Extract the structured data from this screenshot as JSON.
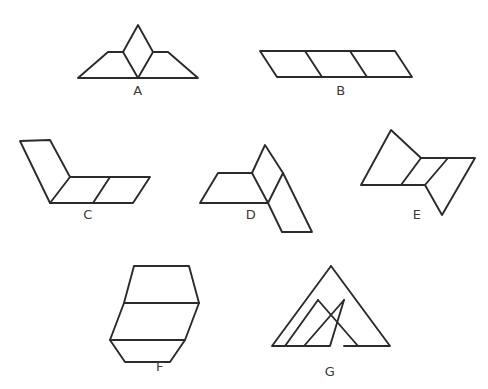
{
  "page": {
    "background_color": "#ffffff",
    "stroke_color": "#2b2b2b",
    "label_color": "#3a3a3a",
    "width": 488,
    "height": 389
  },
  "figures": [
    {
      "id": "A",
      "label": "A",
      "label_x": 138,
      "label_y": 95,
      "cell_count": 3,
      "arrangement": "left trapezoid, upright diamond in the middle, right trapezoid; flat common baseline",
      "outline": "78,78 108,52 123,52 138,25 153,52 168,52 198,78",
      "outline_points": [
        [
          78,
          78
        ],
        [
          108,
          52
        ],
        [
          123,
          52
        ],
        [
          138,
          25
        ],
        [
          153,
          52
        ],
        [
          168,
          52
        ],
        [
          198,
          78
        ]
      ],
      "base_line": [
        [
          78,
          78
        ],
        [
          198,
          78
        ]
      ],
      "dividers": [
        [
          [
            123,
            52
          ],
          [
            138,
            78
          ]
        ],
        [
          [
            153,
            52
          ],
          [
            138,
            78
          ]
        ]
      ]
    },
    {
      "id": "B",
      "label": "B",
      "label_x": 341,
      "label_y": 95,
      "cell_count": 3,
      "arrangement": "three leaning parallelogram cells in a single horizontal row",
      "outline": "260,51 395,51 412,77 277,77",
      "outline_points": [
        [
          260,
          51
        ],
        [
          395,
          51
        ],
        [
          412,
          77
        ],
        [
          277,
          77
        ]
      ],
      "dividers": [
        [
          [
            305,
            51
          ],
          [
            322,
            77
          ]
        ],
        [
          [
            350,
            51
          ],
          [
            367,
            77
          ]
        ]
      ]
    },
    {
      "id": "C",
      "label": "C",
      "label_x": 88,
      "label_y": 219,
      "cell_count": 3,
      "arrangement": "one cell slanting up-left, joined to two cells in a horizontal row",
      "outline": "20,141 50,140 70,177 150,177 150,177 133,203 50,203",
      "outline_points": [
        [
          20,
          141
        ],
        [
          50,
          140
        ],
        [
          70,
          177
        ],
        [
          150,
          177
        ],
        [
          133,
          203
        ],
        [
          50,
          203
        ]
      ],
      "dividers": [
        [
          [
            70,
            177
          ],
          [
            50,
            203
          ]
        ],
        [
          [
            110,
            177
          ],
          [
            93,
            203
          ]
        ]
      ]
    },
    {
      "id": "D",
      "label": "D",
      "label_x": 251,
      "label_y": 219,
      "cell_count": 3,
      "arrangement": "horizontal left cell, upward diamond cell, cell slanting down to the right",
      "outline": "218,173 252,173 265,145 283,173 312,232 282,232 268,203 200,203",
      "outline_points": [
        [
          218,
          173
        ],
        [
          252,
          173
        ],
        [
          265,
          145
        ],
        [
          283,
          173
        ],
        [
          312,
          232
        ],
        [
          282,
          232
        ],
        [
          268,
          203
        ],
        [
          200,
          203
        ]
      ],
      "dividers": [
        [
          [
            252,
            173
          ],
          [
            268,
            203
          ]
        ],
        [
          [
            283,
            173
          ],
          [
            268,
            203
          ]
        ]
      ]
    },
    {
      "id": "E",
      "label": "E",
      "label_x": 417,
      "label_y": 219,
      "cell_count": 3,
      "arrangement": "cell slanting up-left, horizontal middle cell, cell slanting down-right",
      "outline": "391,130 421,158 475,158 442,215 425,185 361,185",
      "outline_points": [
        [
          391,
          130
        ],
        [
          421,
          158
        ],
        [
          475,
          158
        ],
        [
          442,
          215
        ],
        [
          425,
          185
        ],
        [
          361,
          185
        ]
      ],
      "dividers": [
        [
          [
            421,
            158
          ],
          [
            401,
            185
          ]
        ],
        [
          [
            448,
            158
          ],
          [
            425,
            185
          ]
        ]
      ]
    },
    {
      "id": "F",
      "label": "F",
      "label_x": 160,
      "label_y": 371,
      "cell_count": 3,
      "arrangement": "vertical stack: wide trapezoid on top, slanted middle cell, wide trapezoid at the bottom",
      "outline": "134,266 189,266 199,303 124,303",
      "outline_points_top": [
        [
          134,
          266
        ],
        [
          189,
          266
        ],
        [
          199,
          303
        ],
        [
          124,
          303
        ]
      ],
      "outline_points_middle": [
        [
          124,
          303
        ],
        [
          199,
          303
        ],
        [
          185,
          340
        ],
        [
          110,
          340
        ]
      ],
      "outline_points_bottom": [
        [
          110,
          340
        ],
        [
          185,
          340
        ],
        [
          170,
          362
        ],
        [
          125,
          362
        ]
      ],
      "dividers": []
    },
    {
      "id": "G",
      "label": "G",
      "label_x": 330,
      "label_y": 376,
      "cell_count": 3,
      "arrangement": "two large triangles leaning together with a crossing X at the centre, forming an A shape",
      "outline_points_left": [
        [
          331,
          266
        ],
        [
          285,
          346
        ],
        [
          330,
          346
        ],
        [
          376,
          266
        ]
      ],
      "outline_points_right": [
        [
          318,
          300
        ],
        [
          272,
          346
        ],
        [
          318,
          346
        ]
      ],
      "outline_points_extra": [
        [
          344,
          300
        ],
        [
          390,
          346
        ],
        [
          344,
          346
        ]
      ],
      "dividers": [
        [
          [
            318,
            300
          ],
          [
            376,
            266
          ]
        ],
        [
          [
            344,
            300
          ],
          [
            285,
            346
          ]
        ]
      ]
    }
  ]
}
